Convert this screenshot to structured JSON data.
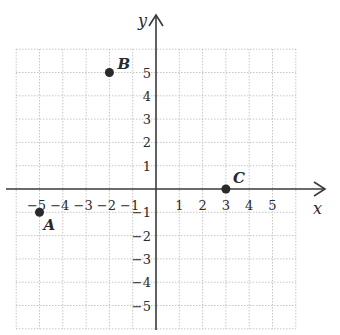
{
  "diagram": {
    "type": "coordinate-plane",
    "x_axis": {
      "label": "x",
      "ticks": [
        -5,
        -4,
        -3,
        -2,
        -1,
        1,
        2,
        3,
        4,
        5
      ],
      "tick_labels": [
        "−5",
        "−4",
        "−3",
        "−2",
        "−1",
        "1",
        "2",
        "3",
        "4",
        "5"
      ]
    },
    "y_axis": {
      "label": "y",
      "ticks": [
        5,
        4,
        3,
        2,
        1,
        -1,
        -2,
        -3,
        -4,
        -5
      ],
      "tick_labels": [
        "5",
        "4",
        "3",
        "2",
        "1",
        "−1",
        "−2",
        "−3",
        "−4",
        "−5"
      ]
    },
    "grid": {
      "range": [
        -6,
        6
      ],
      "style": "dotted"
    },
    "points": [
      {
        "name": "A",
        "x": -5,
        "y": -1
      },
      {
        "name": "B",
        "x": -2,
        "y": 5
      },
      {
        "name": "C",
        "x": 3,
        "y": 0
      }
    ],
    "colors": {
      "grid": "#b8b8b8",
      "axis": "#3a3a3a",
      "point": "#2a2a2a"
    }
  }
}
